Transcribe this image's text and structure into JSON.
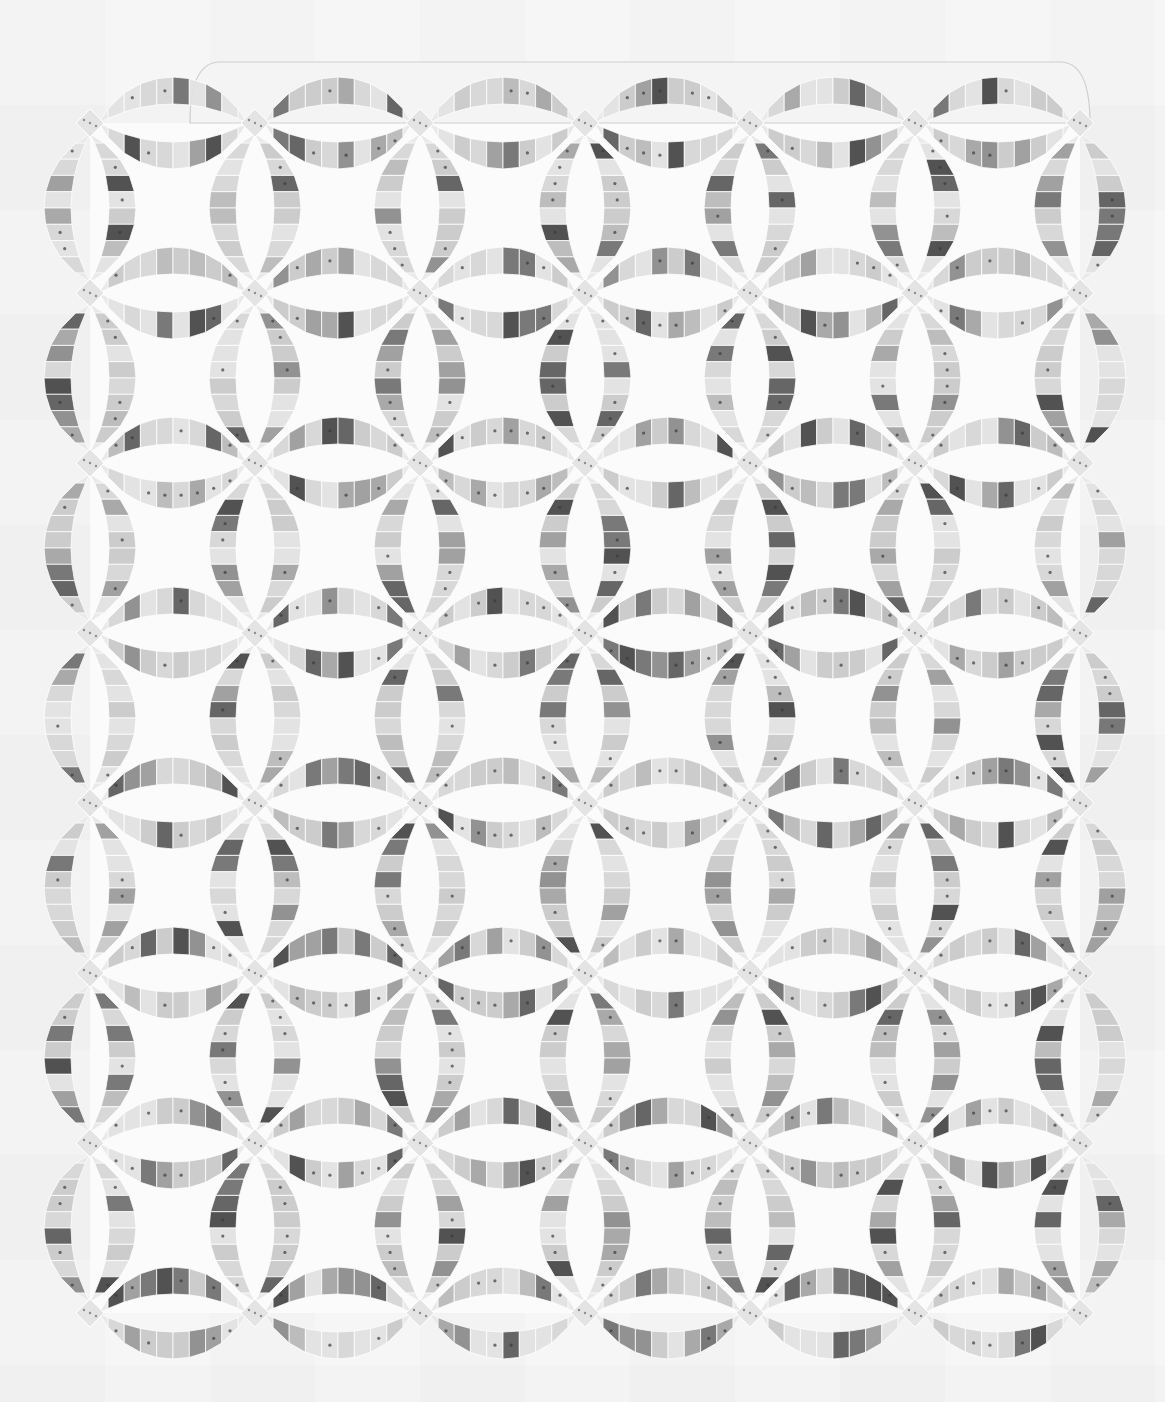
{
  "image": {
    "subject": "Double Wedding Ring quilt, black-and-white photograph",
    "width": 1165,
    "height": 1402,
    "background_color": "#f6f6f6",
    "quilt_ground_color": "#fbfbfb"
  },
  "quilt": {
    "pattern": "double-wedding-ring",
    "ring_columns": 6,
    "ring_rows": 7,
    "vertical_melon_x": [
      90,
      255,
      420,
      585,
      750,
      915,
      1080
    ],
    "vertical_melon_y": [
      208,
      378,
      548,
      718,
      888,
      1058,
      1228
    ],
    "horizontal_melon_x": [
      173,
      338,
      503,
      668,
      833,
      998
    ],
    "horizontal_melon_y": [
      123,
      293,
      463,
      633,
      803,
      973,
      1143,
      1313
    ],
    "melon_half_length": 74,
    "outer_sagitta": 46,
    "inner_sagitta": 19,
    "patches_per_arc": 8,
    "cornerstone_size": 28,
    "top_band": {
      "x1": 190,
      "x2": 1090,
      "y": 62
    },
    "patch_shades": [
      "#5a5a5a",
      "#6e6e6e",
      "#8a8a8a",
      "#a3a3a3",
      "#b8b8b8",
      "#c9c9c9",
      "#d6d6d6",
      "#e2e2e2",
      "#444444",
      "#9a9a9a"
    ],
    "cornerstone_shade": "#e4e4e4",
    "seam_color": "#ffffff"
  }
}
